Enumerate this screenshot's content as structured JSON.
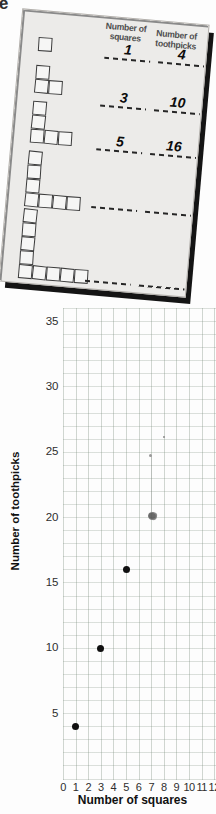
{
  "page": {
    "corner_fragment": "e"
  },
  "worksheet": {
    "col1_header": {
      "line1": "Number of",
      "line2": "squares"
    },
    "col2_header": {
      "line1": "Number of",
      "line2": "toothpicks"
    },
    "rows": [
      {
        "squares": "1",
        "toothpicks": "4"
      },
      {
        "squares": "3",
        "toothpicks": "10"
      },
      {
        "squares": "5",
        "toothpicks": "16"
      },
      {
        "squares": "",
        "toothpicks": ""
      },
      {
        "squares": "",
        "toothpicks": ""
      }
    ],
    "figures_squares": [
      1,
      3,
      5,
      7,
      9
    ]
  },
  "chart_data": {
    "type": "scatter",
    "title": "",
    "xlabel": "Number of squares",
    "ylabel": "Number of toothpicks",
    "x_ticks": [
      "0",
      "1",
      "2",
      "3",
      "4",
      "5",
      "6",
      "7",
      "8",
      "9",
      "10",
      "11",
      "12"
    ],
    "y_ticks": [
      5,
      10,
      15,
      20,
      25,
      30,
      35
    ],
    "xlim": [
      0,
      12.2
    ],
    "ylim": [
      0,
      36
    ],
    "grid": true,
    "legend": null,
    "points": [
      {
        "x": 1,
        "y": 4
      },
      {
        "x": 3,
        "y": 10
      },
      {
        "x": 5,
        "y": 16
      }
    ]
  }
}
